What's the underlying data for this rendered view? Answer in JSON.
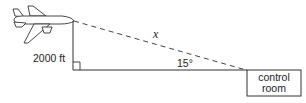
{
  "diagram": {
    "type": "right-triangle-word-problem",
    "labels": {
      "hypotenuse": "x",
      "height": "2000 ft",
      "angle": "15°",
      "destination_line1": "control",
      "destination_line2": "room"
    },
    "objects": {
      "aircraft": "airplane-icon",
      "destination": "control room box"
    },
    "colors": {
      "stroke": "#333333",
      "background": "#ffffff"
    }
  }
}
